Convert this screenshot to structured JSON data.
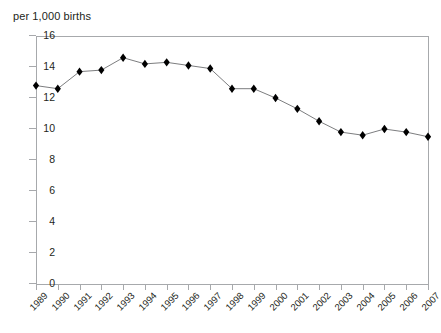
{
  "chart_data": {
    "type": "line",
    "title": "",
    "subtitle": "",
    "ylabel": "per 1,000 births",
    "xlabel": "",
    "ylim": [
      0,
      16
    ],
    "ytick_values": [
      16,
      14,
      12,
      10,
      8,
      6,
      4,
      2,
      0
    ],
    "ytick_labels": [
      "16",
      "14",
      "12",
      "10",
      "8",
      "6",
      "4",
      "2",
      "0"
    ],
    "grid": false,
    "legend_position": "none",
    "marker": "diamond",
    "line_color": "#6d6e71",
    "marker_color": "#000000",
    "axis_color": "#a7a9ac",
    "categories": [
      "1989",
      "1990",
      "1991",
      "1992",
      "1993",
      "1994",
      "1995",
      "1996",
      "1997",
      "1998",
      "1999",
      "2000",
      "2001",
      "2002",
      "2003",
      "2004",
      "2005",
      "2006",
      "2007"
    ],
    "values": [
      12.8,
      12.6,
      13.7,
      13.8,
      14.6,
      14.2,
      14.3,
      14.1,
      13.9,
      12.6,
      12.6,
      12.0,
      11.3,
      10.5,
      9.8,
      9.6,
      10.0,
      9.8,
      9.5
    ],
    "series": [
      {
        "name": "rate per 1,000 births",
        "values": [
          12.8,
          12.6,
          13.7,
          13.8,
          14.6,
          14.2,
          14.3,
          14.1,
          13.9,
          12.6,
          12.6,
          12.0,
          11.3,
          10.5,
          9.8,
          9.6,
          10.0,
          9.8,
          9.5
        ]
      }
    ]
  }
}
